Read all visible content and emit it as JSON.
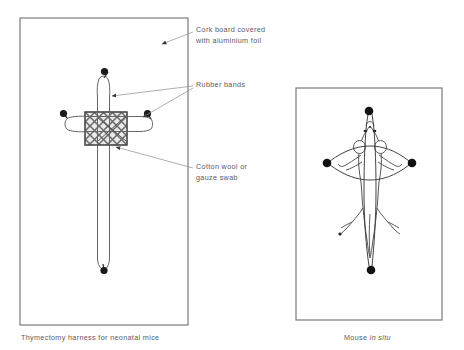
{
  "figure": {
    "background_color": "#ffffff",
    "ink_color": "#4a4a4a",
    "line_color": "#555555"
  },
  "panels": {
    "left": {
      "name": "thymectomy-harness-panel",
      "caption": "Thymectomy harness for neonatal mice",
      "border": {
        "x": 20,
        "y": 18,
        "width": 168,
        "height": 307
      }
    },
    "right": {
      "name": "mouse-in-situ-panel",
      "caption_prefix": "Mouse",
      "caption_italic": "in situ",
      "border": {
        "x": 296,
        "y": 88,
        "width": 146,
        "height": 232
      }
    }
  },
  "annotations": [
    {
      "id": "cork-board",
      "line1": "Cork board covered",
      "line2": "with aluminium foil",
      "target_x": 160,
      "target_y": 44
    },
    {
      "id": "rubber-bands",
      "line1": "Rubber bands",
      "line2": "",
      "target_x": 110,
      "target_y": 95
    },
    {
      "id": "cotton-wool",
      "line1": "Cotton wool or",
      "line2": "gauze swab",
      "target_x": 113,
      "target_y": 146
    }
  ],
  "harness": {
    "vertical_band": {
      "name": "vertical-rubber-band",
      "top_pin": {
        "x": 104,
        "y": 72
      },
      "bottom_pin": {
        "x": 104,
        "y": 270
      },
      "loop_left_x": 98,
      "loop_right_x": 110
    },
    "horizontal_band": {
      "name": "horizontal-rubber-band",
      "left_pin": {
        "x": 64,
        "y": 114
      },
      "right_pin": {
        "x": 148,
        "y": 114
      },
      "loop_top_y": 119,
      "loop_bottom_y": 131
    },
    "swab": {
      "name": "cotton-wool-gauze-swab",
      "x": 85,
      "y": 112,
      "width": 42,
      "height": 33,
      "hatch": "cross-hatch"
    },
    "pin_count": 4
  },
  "mouse": {
    "name": "mouse-specimen",
    "orientation": "ventral-supine",
    "pins": [
      {
        "id": "head-pin",
        "x": 369,
        "y": 111
      },
      {
        "id": "left-pin",
        "x": 327,
        "y": 163
      },
      {
        "id": "right-pin",
        "x": 412,
        "y": 163
      },
      {
        "id": "tail-pin",
        "x": 371,
        "y": 270
      }
    ],
    "body_center_x": 370,
    "bands": [
      "vertical-band-head-to-tail",
      "horizontal-band-forelimbs"
    ]
  }
}
